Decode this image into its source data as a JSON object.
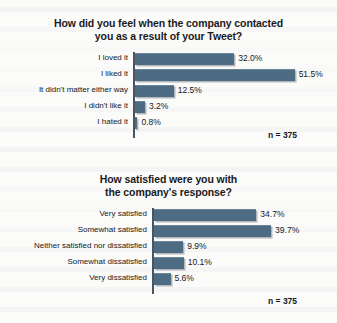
{
  "chart_data": [
    {
      "type": "bar",
      "orientation": "horizontal",
      "title": "How did you feel when the company contacted\nyou as a result of your Tweet?",
      "categories": [
        "I loved it",
        "I liked it",
        "It didn't matter either way",
        "I didn't like it",
        "I hated it"
      ],
      "values": [
        32.0,
        51.5,
        12.5,
        3.2,
        0.8
      ],
      "value_labels": [
        "32.0%",
        "51.5%",
        "12.5%",
        "3.2%",
        "0.8%"
      ],
      "xlabel": "",
      "ylabel": "",
      "xlim": [
        0,
        55
      ],
      "grid": false,
      "legend": "none",
      "sample_size_note": "n = 375",
      "bar_color": "#4e6b84"
    },
    {
      "type": "bar",
      "orientation": "horizontal",
      "title": "How satisfied were you with\nthe company's response?",
      "categories": [
        "Very satisfied",
        "Somewhat satisfied",
        "Neither satisfied nor dissatisfied",
        "Somewhat dissatisfied",
        "Very dissatisfied"
      ],
      "values": [
        34.7,
        39.7,
        9.9,
        10.1,
        5.6
      ],
      "value_labels": [
        "34.7%",
        "39.7%",
        "9.9%",
        "10.1%",
        "5.6%"
      ],
      "xlabel": "",
      "ylabel": "",
      "xlim": [
        0,
        42
      ],
      "grid": false,
      "legend": "none",
      "sample_size_note": "n = 375",
      "bar_color": "#4e6b84"
    }
  ]
}
